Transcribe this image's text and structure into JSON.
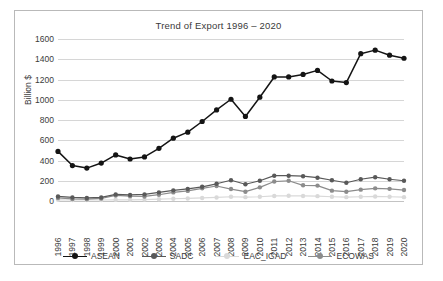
{
  "chart_data": {
    "type": "line",
    "title": "Trend of Export 1996 – 2020",
    "xlabel": "",
    "ylabel": "Billion $",
    "ylim": [
      0,
      1600
    ],
    "yticks": [
      0,
      200,
      400,
      600,
      800,
      1000,
      1200,
      1400,
      1600
    ],
    "grid": true,
    "legend_position": "bottom",
    "categories": [
      "1996",
      "1997",
      "1998",
      "1999",
      "2000",
      "2001",
      "2002",
      "2003",
      "2004",
      "2005",
      "2006",
      "2007",
      "2008",
      "2009",
      "2010",
      "2011",
      "2012",
      "2013",
      "2014",
      "2015",
      "2016",
      "2017",
      "2018",
      "2019",
      "2020"
    ],
    "series": [
      {
        "name": "ASEAN",
        "color": "#141414",
        "values": [
          490,
          350,
          325,
          375,
          455,
          415,
          435,
          520,
          620,
          680,
          785,
          900,
          1005,
          835,
          1025,
          1225,
          1225,
          1250,
          1290,
          1185,
          1170,
          1455,
          1490,
          1440,
          1410
        ]
      },
      {
        "name": "SADC",
        "color": "#595959",
        "values": [
          45,
          35,
          30,
          35,
          65,
          60,
          65,
          85,
          105,
          120,
          140,
          170,
          205,
          165,
          200,
          250,
          250,
          245,
          230,
          205,
          180,
          215,
          235,
          215,
          200
        ]
      },
      {
        "name": "EAC_IGAD",
        "color": "#d9d9d9",
        "values": [
          12,
          10,
          10,
          10,
          12,
          12,
          14,
          18,
          22,
          25,
          30,
          35,
          42,
          38,
          42,
          50,
          52,
          50,
          48,
          42,
          38,
          42,
          45,
          42,
          38
        ]
      },
      {
        "name": "ECOWAS",
        "color": "#8c8c8c",
        "values": [
          30,
          20,
          18,
          25,
          55,
          48,
          45,
          62,
          85,
          100,
          125,
          148,
          118,
          92,
          135,
          192,
          200,
          155,
          152,
          102,
          92,
          112,
          125,
          120,
          108
        ]
      }
    ]
  },
  "chart": {
    "title": "Trend of Export 1996 – 2020",
    "y_axis_title": "Billion $"
  }
}
